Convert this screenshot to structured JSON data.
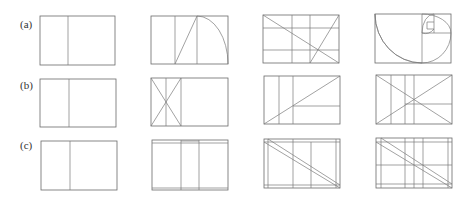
{
  "figure": {
    "rows": [
      {
        "label": "(a)",
        "label_pos": [
          20,
          19
        ],
        "panels": [
          {
            "rect": [
              40,
              16,
              75,
              49
            ],
            "lines": [
              [
                68,
                16,
                68,
                65
              ]
            ],
            "paths": []
          },
          {
            "rect": [
              151,
              16,
              77,
              48
            ],
            "lines": [
              [
                175,
                16,
                175,
                64
              ],
              [
                197,
                16,
                197,
                64
              ],
              [
                175,
                64,
                197,
                16
              ]
            ],
            "paths": [
              "M197,16 A31,48 0 0 1 228,64"
            ]
          },
          {
            "rect": [
              263,
              15,
              76,
              48
            ],
            "lines": [
              [
                292,
                15,
                292,
                63
              ],
              [
                310,
                15,
                310,
                63
              ],
              [
                263,
                28,
                339,
                28
              ],
              [
                263,
                50,
                339,
                50
              ],
              [
                263,
                15,
                339,
                63
              ],
              [
                310,
                63,
                339,
                15
              ]
            ],
            "paths": []
          },
          {
            "rect": [
              375,
              14,
              76,
              49
            ],
            "lines": [
              [
                422,
                14,
                422,
                63
              ],
              [
                422,
                33,
                451,
                33
              ],
              [
                434,
                14,
                434,
                33
              ],
              [
                427,
                22,
                434,
                22
              ],
              [
                427,
                22,
                427,
                29
              ],
              [
                427,
                29,
                434,
                29
              ]
            ],
            "paths": [
              "M422,63 A47,49 0 0 1 375,14 M375,14 L375,14",
              "M375,14 A47,49 0 0 0 422,63",
              "M422,14 A29,19 0 0 1 451,33",
              "M451,33 A29,30 0 0 1 422,63",
              "M434,14 A12,19 0 0 0 422,33",
              "M422,33 A12,14 0 0 0 434,29"
            ]
          }
        ]
      },
      {
        "label": "(b)",
        "label_pos": [
          20,
          80
        ],
        "panels": [
          {
            "rect": [
              40,
              79,
              76,
              48
            ],
            "lines": [
              [
                69,
                79,
                69,
                127
              ]
            ],
            "paths": []
          },
          {
            "rect": [
              151,
              78,
              77,
              48
            ],
            "lines": [
              [
                166,
                78,
                166,
                126
              ],
              [
                181,
                78,
                181,
                126
              ],
              [
                151,
                78,
                181,
                126
              ],
              [
                181,
                78,
                151,
                126
              ]
            ],
            "paths": []
          },
          {
            "rect": [
              264,
              76,
              76,
              48
            ],
            "lines": [
              [
                279,
                76,
                279,
                124
              ],
              [
                293,
                76,
                293,
                124
              ],
              [
                264,
                124,
                340,
                76
              ],
              [
                293,
                106,
                340,
                106
              ]
            ],
            "paths": []
          },
          {
            "rect": [
              376,
              75,
              76,
              49
            ],
            "lines": [
              [
                391,
                75,
                391,
                124
              ],
              [
                405,
                75,
                405,
                124
              ],
              [
                414,
                75,
                414,
                124
              ],
              [
                376,
                75,
                452,
                124
              ],
              [
                376,
                124,
                452,
                75
              ],
              [
                405,
                104,
                452,
                104
              ]
            ],
            "paths": []
          }
        ]
      },
      {
        "label": "(c)",
        "label_pos": [
          20,
          140
        ],
        "panels": [
          {
            "rect": [
              41,
              141,
              76,
              49
            ],
            "lines": [
              [
                70,
                141,
                70,
                190
              ]
            ],
            "paths": []
          },
          {
            "rect": [
              152,
              140,
              76,
              50
            ],
            "lines": [
              [
                152,
                143,
                228,
                143
              ],
              [
                152,
                188,
                228,
                188
              ],
              [
                181,
                140,
                181,
                190
              ],
              [
                199,
                140,
                199,
                190
              ],
              [
                181,
                141,
                199,
                141
              ]
            ],
            "paths": []
          },
          {
            "rect": [
              264,
              139,
              76,
              49
            ],
            "lines": [
              [
                264,
                142,
                340,
                142
              ],
              [
                264,
                185,
                340,
                185
              ],
              [
                268,
                139,
                268,
                188
              ],
              [
                336,
                139,
                336,
                188
              ],
              [
                293,
                139,
                293,
                188
              ],
              [
                311,
                142,
                311,
                188
              ],
              [
                264,
                142,
                340,
                188
              ],
              [
                268,
                139,
                340,
                185
              ]
            ],
            "paths": []
          },
          {
            "rect": [
              376,
              138,
              76,
              50
            ],
            "lines": [
              [
                376,
                142,
                452,
                142
              ],
              [
                376,
                184,
                452,
                184
              ],
              [
                376,
                165,
                452,
                165
              ],
              [
                381,
                138,
                381,
                188
              ],
              [
                448,
                138,
                448,
                188
              ],
              [
                405,
                138,
                405,
                188
              ],
              [
                414,
                138,
                414,
                188
              ],
              [
                423,
                138,
                423,
                188
              ],
              [
                376,
                142,
                452,
                188
              ],
              [
                381,
                138,
                452,
                184
              ]
            ],
            "paths": []
          }
        ]
      }
    ]
  }
}
